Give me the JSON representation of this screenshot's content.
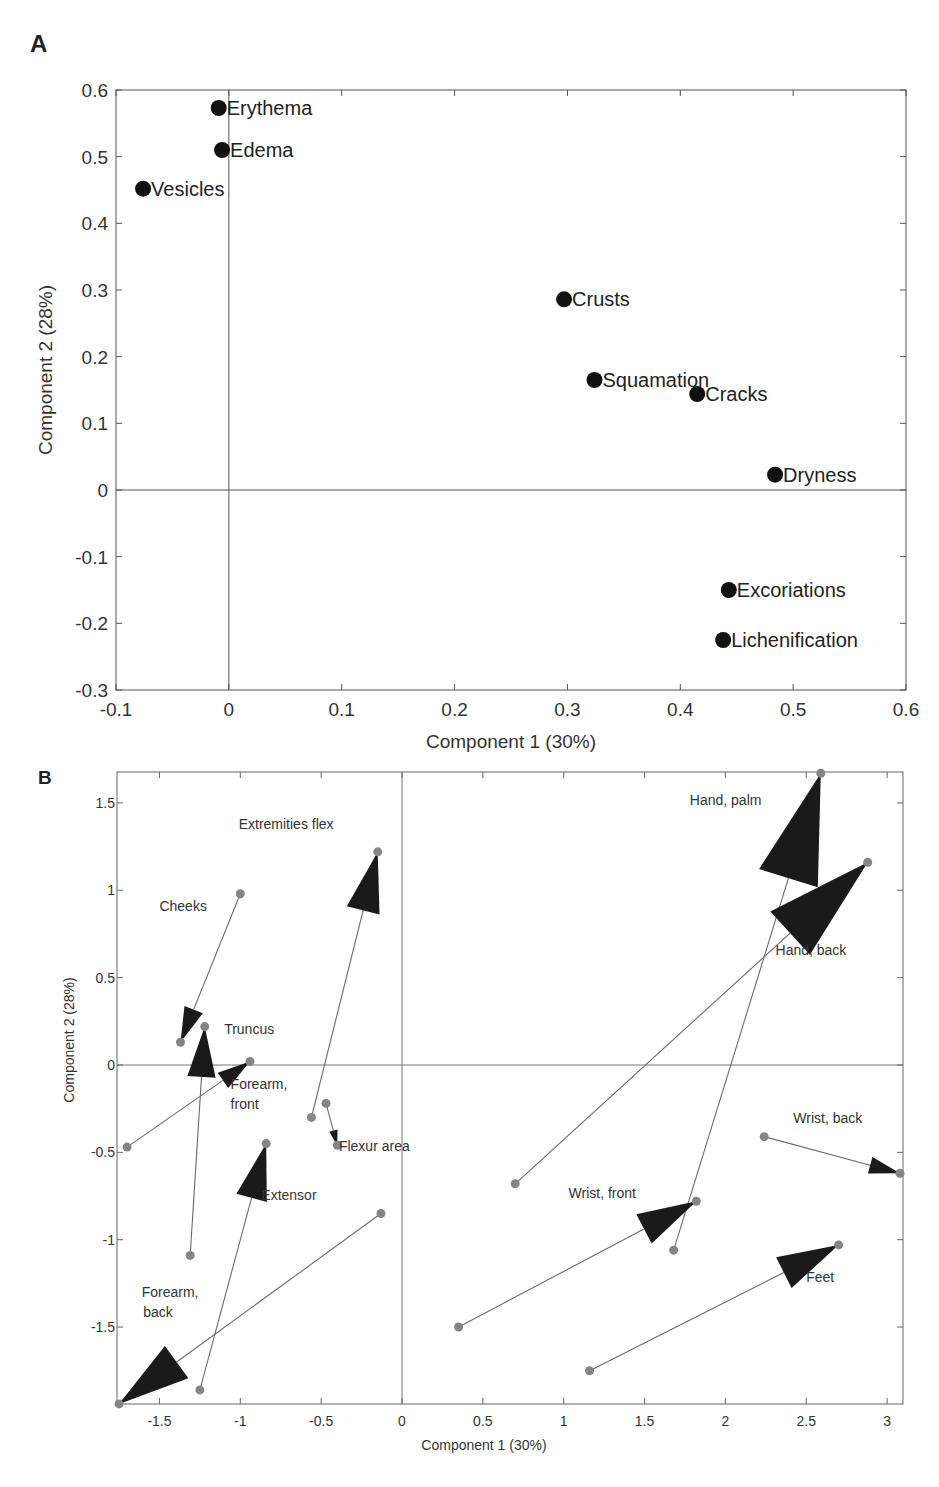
{
  "chart_data": [
    {
      "panel": "A",
      "type": "scatter",
      "title": "",
      "xlabel": "Component 1 (30%)",
      "ylabel": "Component 2 (28%)",
      "xlim": [
        -0.1,
        0.6
      ],
      "ylim": [
        -0.3,
        0.6
      ],
      "xticks": [
        "-0.1",
        "0",
        "0.1",
        "0.2",
        "0.3",
        "0.4",
        "0.5",
        "0.6"
      ],
      "yticks": [
        "-0.3",
        "-0.2",
        "-0.1",
        "0",
        "0.1",
        "0.2",
        "0.3",
        "0.4",
        "0.5",
        "0.6"
      ],
      "reference_lines": {
        "x": 0,
        "y": 0
      },
      "grid": false,
      "marker_color": "#111111",
      "points": [
        {
          "label": "Erythema",
          "x": -0.009,
          "y": 0.573
        },
        {
          "label": "Edema",
          "x": -0.006,
          "y": 0.51
        },
        {
          "label": "Vesicles",
          "x": -0.076,
          "y": 0.452
        },
        {
          "label": "Crusts",
          "x": 0.297,
          "y": 0.286
        },
        {
          "label": "Squamation",
          "x": 0.324,
          "y": 0.165
        },
        {
          "label": "Cracks",
          "x": 0.415,
          "y": 0.144
        },
        {
          "label": "Dryness",
          "x": 0.484,
          "y": 0.023
        },
        {
          "label": "Excoriations",
          "x": 0.443,
          "y": -0.15
        },
        {
          "label": "Lichenification",
          "x": 0.438,
          "y": -0.225
        }
      ]
    },
    {
      "panel": "B",
      "type": "scatter",
      "title": "",
      "xlabel": "Component 1 (30%)",
      "ylabel": "Component 2 (28%)",
      "xlim": [
        -1.76,
        3.1
      ],
      "ylim": [
        -1.94,
        1.68
      ],
      "xticks": [
        "-1.5",
        "-1",
        "-0.5",
        "0",
        "0.5",
        "1",
        "1.5",
        "2",
        "2.5",
        "3"
      ],
      "yticks": [
        "-1.5",
        "-1",
        "-0.5",
        "0",
        "0.5",
        "1",
        "1.5"
      ],
      "reference_lines": {
        "x": 0,
        "y": 0
      },
      "grid": false,
      "dot_color": "#858585",
      "arrow_color": "#1a1a1a",
      "line_color": "#6a6a6a",
      "arrows": [
        {
          "label": "Cheeks",
          "from": [
            -1.0,
            0.98
          ],
          "to": [
            -1.37,
            0.13
          ]
        },
        {
          "label": "Truncus",
          "from": [
            -1.31,
            -1.09
          ],
          "to": [
            -1.22,
            0.22
          ]
        },
        {
          "label": "Forearm, front",
          "from": [
            -1.7,
            -0.47
          ],
          "to": [
            -0.94,
            0.02
          ]
        },
        {
          "label": "Extremities flex",
          "from": [
            -0.56,
            -0.3
          ],
          "to": [
            -0.15,
            1.22
          ]
        },
        {
          "label": "Flexur area",
          "from": [
            -0.47,
            -0.22
          ],
          "to": [
            -0.4,
            -0.46
          ]
        },
        {
          "label": "Extensor",
          "from": [
            -1.25,
            -1.86
          ],
          "to": [
            -0.84,
            -0.45
          ]
        },
        {
          "label": "Forearm, back",
          "from": [
            -0.13,
            -0.85
          ],
          "to": [
            -1.75,
            -1.94
          ]
        },
        {
          "label": "Hand, palm",
          "from": [
            1.68,
            -1.06
          ],
          "to": [
            2.59,
            1.67
          ]
        },
        {
          "label": "Hand, back",
          "from": [
            0.7,
            -0.68
          ],
          "to": [
            2.88,
            1.16
          ]
        },
        {
          "label": "Wrist, front",
          "from": [
            0.35,
            -1.5
          ],
          "to": [
            1.82,
            -0.78
          ]
        },
        {
          "label": "Wrist, back",
          "from": [
            2.24,
            -0.41
          ],
          "to": [
            3.08,
            -0.62
          ]
        },
        {
          "label": "Feet",
          "from": [
            1.16,
            -1.75
          ],
          "to": [
            2.7,
            -1.03
          ]
        }
      ],
      "annotations": [
        {
          "text": "Cheeks",
          "x": -1.5,
          "y": 0.88
        },
        {
          "text": "Truncus",
          "x": -1.1,
          "y": 0.18
        },
        {
          "text": "Forearm,",
          "x": -1.06,
          "y": -0.14
        },
        {
          "text": "front",
          "x": -1.06,
          "y": -0.25
        },
        {
          "text": "Extremities flex",
          "x": -1.01,
          "y": 1.35
        },
        {
          "text": "Flexur area",
          "x": -0.39,
          "y": -0.49
        },
        {
          "text": "Extensor",
          "x": -0.87,
          "y": -0.77
        },
        {
          "text": "Forearm,",
          "x": -1.61,
          "y": -1.33
        },
        {
          "text": "back",
          "x": -1.6,
          "y": -1.44
        },
        {
          "text": "Hand, palm",
          "x": 1.78,
          "y": 1.49
        },
        {
          "text": "Hand, back",
          "x": 2.31,
          "y": 0.63
        },
        {
          "text": "Wrist, front",
          "x": 1.03,
          "y": -0.76
        },
        {
          "text": "Wrist, back",
          "x": 2.42,
          "y": -0.33
        },
        {
          "text": "Feet",
          "x": 2.5,
          "y": -1.24
        }
      ]
    }
  ],
  "panels": {
    "a_label": "A",
    "b_label": "B"
  }
}
